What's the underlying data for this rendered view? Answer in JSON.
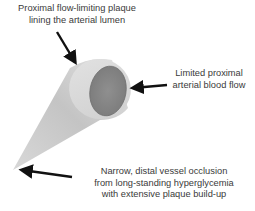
{
  "figure": {
    "labels": {
      "proximal_plaque": [
        "Proximal flow-limiting plaque",
        "lining the arterial lumen"
      ],
      "blood_flow": [
        "Limited proximal",
        "arterial blood flow"
      ],
      "distal_occlusion": [
        "Narrow, distal vessel occlusion",
        "from long-standing hyperglycemia",
        "with extensive plaque build-up"
      ]
    },
    "colors": {
      "cone_light": "#e6e6e6",
      "cone_dark": "#bdbdbd",
      "lumen": "#8a8a8a",
      "arrow": "#111111",
      "text": "#3a3a3a"
    },
    "arrows": [
      {
        "target": "plaque-rim",
        "from": [
          50,
          30
        ],
        "to": [
          76,
          64
        ]
      },
      {
        "target": "lumen",
        "from": [
          166,
          85
        ],
        "to": [
          131,
          88
        ]
      },
      {
        "target": "distal-tip",
        "from": [
          72,
          177
        ],
        "to": [
          20,
          170
        ]
      }
    ]
  }
}
